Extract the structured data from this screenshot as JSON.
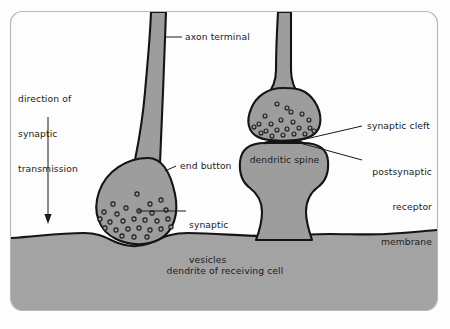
{
  "figure": {
    "frame": {
      "border_color": "#b9b9b9",
      "background_color": "#fdfdfd",
      "corner_radius": 12
    }
  },
  "colors": {
    "cell_fill": "#9d9d9d",
    "dendrite_fill": "#a3a3a3",
    "outline": "#141414",
    "vesicle_stroke": "#1a1a1a",
    "vesicle_fill": "#9d9d9d",
    "text": "#1b1b1b",
    "leader_line": "#1a1a1a",
    "frame_border": "#b9b9b9",
    "page_background": "#ffffff"
  },
  "labels": {
    "direction": {
      "line1": "direction of",
      "line2": "synaptic",
      "line3": "transmission"
    },
    "axon_terminal": "axon terminal",
    "end_button": "end button",
    "synaptic_vesicles": {
      "line1": "synaptic",
      "line2": "vesicles"
    },
    "dendritic_spine": "dendritic spine",
    "synaptic_cleft": "synaptic cleft",
    "postsynaptic_receptor_membrane": {
      "line1": "postsynaptic",
      "line2": "receptor",
      "line3": "membrane"
    },
    "dendrite_of_receiving_cell": "dendrite of receiving cell"
  },
  "structures": [
    {
      "name": "left-axon-terminal",
      "description": "axon shaft descending to end button"
    },
    {
      "name": "left-end-button",
      "description": "bulbous presynaptic terminal containing vesicles"
    },
    {
      "name": "right-axon-terminal",
      "description": "axon shaft descending to terminal on dendritic spine"
    },
    {
      "name": "right-end-button",
      "description": "bulbous presynaptic terminal containing vesicles"
    },
    {
      "name": "dendritic-spine",
      "description": "mushroom shaped protrusion of dendrite"
    },
    {
      "name": "dendrite-band",
      "description": "body of the receiving cell dendrite"
    },
    {
      "name": "synaptic-cleft",
      "description": "gap between presynaptic terminal and postsynaptic membrane"
    }
  ],
  "direction_arrow": {
    "orientation": "downward",
    "meaning": "direction of synaptic transmission"
  },
  "vesicle_counts": {
    "left_end_button": 27,
    "right_end_button": 22
  }
}
